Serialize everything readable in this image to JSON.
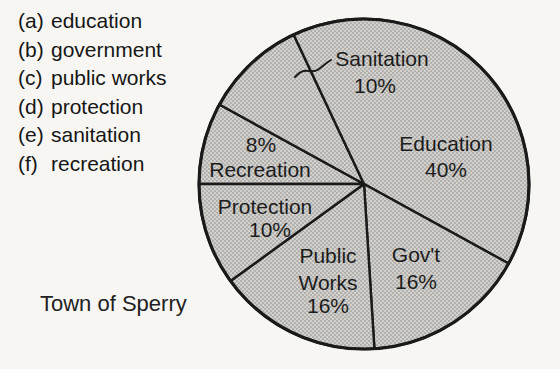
{
  "legend": {
    "items": [
      {
        "marker": "(a)",
        "label": "education"
      },
      {
        "marker": "(b)",
        "label": "government"
      },
      {
        "marker": "(c)",
        "label": "public works"
      },
      {
        "marker": "(d)",
        "label": "protection"
      },
      {
        "marker": "(e)",
        "label": "sanitation"
      },
      {
        "marker": "(f)",
        "label": "recreation"
      }
    ]
  },
  "caption": {
    "text": "Town of Sperry"
  },
  "chart_data": {
    "type": "pie",
    "title": "Town of Sperry",
    "start_angle_deg": 180,
    "direction": "clockwise",
    "stroke_color": "#1a1a1a",
    "pattern_colors": {
      "base": "#d2d1ce",
      "dot": "#aeadaa"
    },
    "slices": [
      {
        "name": "Recreation",
        "value": 8,
        "pct_label": "8%",
        "label_lines": [
          "8%",
          "Recreation"
        ]
      },
      {
        "name": "Sanitation",
        "value": 10,
        "pct_label": "10%",
        "label_lines": [
          "Sanitation",
          "10%"
        ]
      },
      {
        "name": "Education",
        "value": 40,
        "pct_label": "40%",
        "label_lines": [
          "Education",
          "40%"
        ]
      },
      {
        "name": "Gov't",
        "value": 16,
        "pct_label": "16%",
        "label_lines": [
          "Gov't",
          "16%"
        ]
      },
      {
        "name": "Public Works",
        "value": 16,
        "pct_label": "16%",
        "label_lines": [
          "Public",
          "Works",
          "16%"
        ]
      },
      {
        "name": "Protection",
        "value": 10,
        "pct_label": "10%",
        "label_lines": [
          "Protection",
          "10%"
        ]
      }
    ],
    "annotations": [
      {
        "type": "leader-line",
        "text": "Sanitation",
        "points_to": "Sanitation slice"
      }
    ]
  }
}
